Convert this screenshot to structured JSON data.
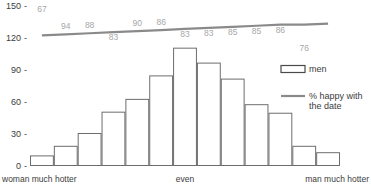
{
  "chart_data": {
    "type": "bar",
    "title": "",
    "subtitle": "",
    "xlabel": "",
    "ylabel": "",
    "ylim": [
      0,
      150
    ],
    "grid": false,
    "y_ticks": [
      "0",
      "30",
      "60",
      "90",
      "120",
      "150"
    ],
    "y_tick_values": [
      0,
      30,
      60,
      90,
      120,
      150
    ],
    "tick_dash": "-",
    "categories": [
      "1",
      "2",
      "3",
      "4",
      "5",
      "6",
      "7",
      "8",
      "9",
      "10",
      "11",
      "12",
      "13"
    ],
    "category_axis_labels": [
      {
        "text": "woman much hotter",
        "position": "left"
      },
      {
        "text": "even",
        "position": "center"
      },
      {
        "text": "man much hotter",
        "position": "right"
      }
    ],
    "series": [
      {
        "name": "men",
        "type": "bar",
        "values": [
          9,
          18,
          30,
          50,
          62,
          84,
          110,
          96,
          81,
          57,
          49,
          18,
          12
        ]
      },
      {
        "name": "% happy with the date",
        "type": "line",
        "values": [
          67,
          94,
          88,
          83,
          90,
          86,
          83,
          83,
          85,
          85,
          86,
          76,
          100
        ],
        "line_y_values": [
          122,
          123,
          124,
          125,
          126,
          127,
          128,
          129,
          130,
          131,
          132,
          132,
          133
        ],
        "labels": [
          "67",
          "94",
          "88",
          "83",
          "90",
          "86",
          "83",
          "83",
          "85",
          "85",
          "86",
          "76",
          "100"
        ]
      }
    ],
    "legend": {
      "position": "right",
      "entries": [
        {
          "label": "men",
          "marker": "bar-swatch"
        },
        {
          "label": "% happy with the date",
          "marker": "line-swatch"
        }
      ]
    },
    "colors": {
      "bar_fill": "#ffffff",
      "bar_stroke": "#6d6d6d",
      "line": "#8a8a8a",
      "label_text": "#3c3c3c",
      "data_label_text": "#a7a7a7",
      "background": "#ffffff"
    }
  },
  "legend": {
    "men_label": "men",
    "happy_label_line1": "% happy with",
    "happy_label_line2": "the date"
  }
}
